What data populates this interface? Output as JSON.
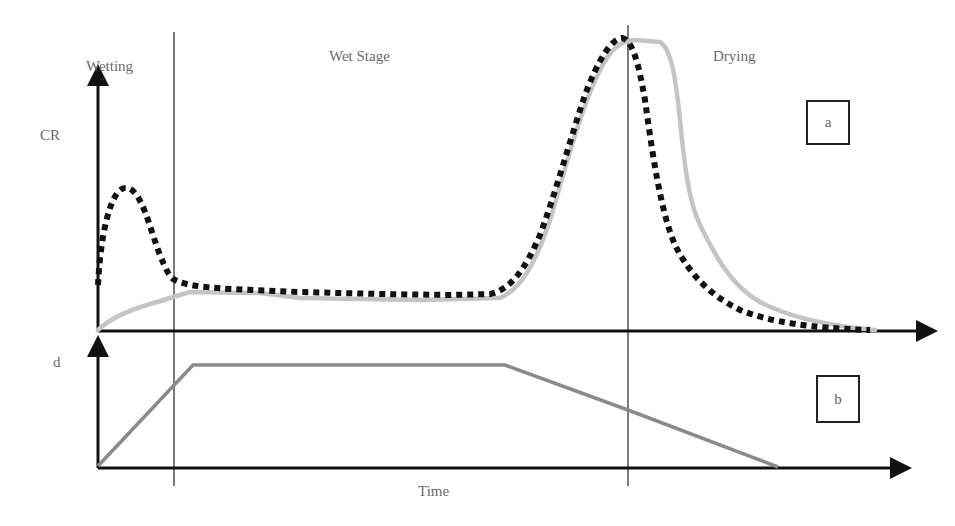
{
  "stages": {
    "wetting": "Wetting",
    "wet_stage": "Wet Stage",
    "drying": "Drying"
  },
  "axes": {
    "top_y_label": "CR",
    "bottom_y_label": "d",
    "x_label": "Time"
  },
  "panels": {
    "top_tag": "a",
    "bottom_tag": "b"
  },
  "colors": {
    "axis": "#111111",
    "divider": "#333333",
    "measured_curve": "#c4c4c4",
    "model_curve": "#111111",
    "thickness_curve": "#8a8a8a",
    "label_text": "#6a6a6a"
  },
  "series": {
    "panel_a": [
      {
        "name": "solid-gray-curve",
        "style": "solid light gray"
      },
      {
        "name": "dotted-black-curve",
        "style": "dotted black"
      }
    ],
    "panel_b": [
      {
        "name": "trapezoid-thickness-curve",
        "style": "solid gray"
      }
    ]
  }
}
